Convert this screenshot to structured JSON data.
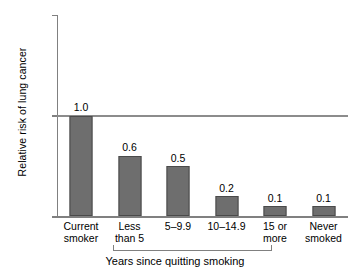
{
  "chart_data": {
    "type": "bar",
    "title": "",
    "xlabel": "",
    "ylabel": "Relative risk of lung cancer",
    "ylim": [
      0,
      2
    ],
    "yticks": [
      "0",
      "1",
      "2"
    ],
    "grid": false,
    "legend": "none",
    "categories": [
      "Current smoker",
      "Less than 5",
      "5–9.9",
      "10–14.9",
      "15 or more",
      "Never smoked"
    ],
    "category_lines": [
      [
        "Current",
        "smoker"
      ],
      [
        "Less",
        "than 5"
      ],
      [
        "5–9.9",
        ""
      ],
      [
        "10–14.9",
        ""
      ],
      [
        "15 or",
        "more"
      ],
      [
        "Never",
        "smoked"
      ]
    ],
    "values": [
      1.0,
      0.6,
      0.5,
      0.2,
      0.1,
      0.1
    ],
    "value_labels": [
      "1.0",
      "0.6",
      "0.5",
      "0.2",
      "0.1",
      "0.1"
    ],
    "reference_line": {
      "y": 1,
      "label": ""
    },
    "group_bracket": {
      "caption": "Years since quitting smoking",
      "covers_categories": [
        "Less than 5",
        "5–9.9",
        "10–14.9",
        "15 or more"
      ]
    },
    "colors": {
      "bar_fill": "#6e6e6e",
      "bar_edge": "#4a4a4a",
      "axis": "#808080",
      "reference_line": "#8c8c8c",
      "text": "#000000",
      "background": "#ffffff"
    }
  }
}
